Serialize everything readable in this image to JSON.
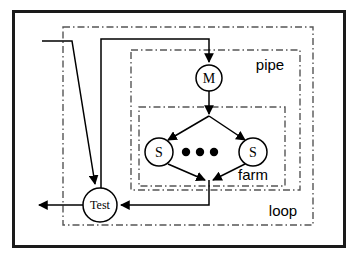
{
  "diagram": {
    "colors": {
      "stroke": "#000000",
      "dashed_box": "#555555",
      "background": "#ffffff",
      "frame": "#1a1a1a"
    },
    "frame": {
      "x": 13,
      "y": 11,
      "width": 332,
      "height": 236
    },
    "groups": [
      {
        "id": "loop",
        "label": "loop",
        "label_x": 283,
        "label_y": 216,
        "x": 63,
        "y": 27,
        "width": 250,
        "height": 198,
        "style": "dash-dot"
      },
      {
        "id": "pipe",
        "label": "pipe",
        "label_x": 270,
        "label_y": 70,
        "x": 131,
        "y": 50,
        "width": 169,
        "height": 140,
        "style": "dash-dot"
      },
      {
        "id": "farm",
        "label": "farm",
        "label_x": 253,
        "label_y": 180,
        "x": 139,
        "y": 107,
        "width": 146,
        "height": 79,
        "style": "dash-dot"
      }
    ],
    "nodes": [
      {
        "id": "master",
        "label": "M",
        "cx": 209,
        "cy": 78,
        "r": 13,
        "font_size": 14
      },
      {
        "id": "slave-left",
        "label": "S",
        "cx": 159,
        "cy": 152,
        "r": 14,
        "font_size": 14
      },
      {
        "id": "slave-right",
        "label": "S",
        "cx": 253,
        "cy": 152,
        "r": 14,
        "font_size": 14
      },
      {
        "id": "test",
        "label": "Test",
        "cx": 100,
        "cy": 205,
        "r": 17,
        "font_size": 12
      }
    ],
    "ellipsis_dots": [
      {
        "cx": 186,
        "cy": 152,
        "r": 4
      },
      {
        "cx": 200,
        "cy": 152,
        "r": 4
      },
      {
        "cx": 214,
        "cy": 152,
        "r": 4
      }
    ],
    "edges": [
      {
        "id": "feedback-into-master",
        "from": "test",
        "to": "master",
        "arrow": true
      },
      {
        "id": "master-to-fanout",
        "from": "master",
        "to": "farm-split",
        "arrow": true
      },
      {
        "id": "fanout-to-slave-left",
        "from": "farm-split",
        "to": "slave-left",
        "arrow": true
      },
      {
        "id": "fanout-to-slave-right",
        "from": "farm-split",
        "to": "slave-right",
        "arrow": true
      },
      {
        "id": "slave-left-to-join",
        "from": "slave-left",
        "to": "farm-join",
        "arrow": true
      },
      {
        "id": "slave-right-to-join",
        "from": "slave-right",
        "to": "farm-join",
        "arrow": true
      },
      {
        "id": "farm-join-to-test",
        "from": "farm-join",
        "to": "test",
        "arrow": true
      },
      {
        "id": "external-input-to-test",
        "from": "input-source",
        "to": "test",
        "arrow": true
      },
      {
        "id": "test-to-output",
        "from": "test",
        "to": "output-sink",
        "arrow": true
      }
    ]
  }
}
